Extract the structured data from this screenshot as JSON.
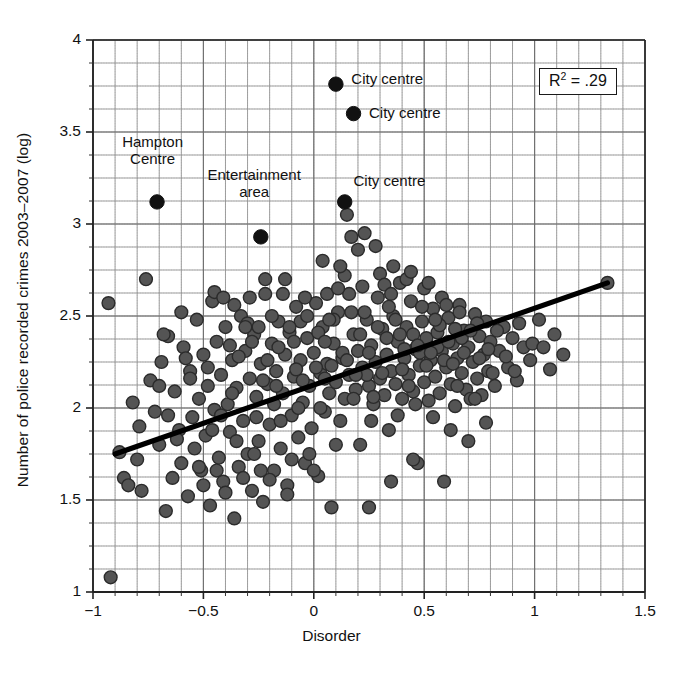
{
  "chart_data": {
    "type": "scatter",
    "title": "",
    "xlabel": "Disorder",
    "ylabel": "Number of police recorded crimes 2003–2007 (log)",
    "xlim": [
      -1,
      1.5
    ],
    "ylim": [
      1,
      4
    ],
    "xticks": [
      -1,
      -0.5,
      0,
      0.5,
      1,
      1.5
    ],
    "xticklabels": [
      "−1",
      "−0.5",
      "0",
      "0.5",
      "1",
      "1.5"
    ],
    "yticks": [
      1,
      1.5,
      2,
      2.5,
      3,
      3.5,
      4
    ],
    "yticklabels": [
      "1",
      "1.5",
      "2",
      "2.5",
      "3",
      "3.5",
      "4"
    ],
    "grid": true,
    "grid_minor_x_step": 0.1,
    "grid_minor_y_step": 0.125,
    "legend": "none",
    "marker_color": "#545454",
    "marker_edge_color": "#2b2b2b",
    "highlight_color": "#111111",
    "fitline_color": "#000000",
    "annotation_box": {
      "label": "R",
      "superscript": "2",
      "equals": " = .29",
      "full_text": "R2 = .29",
      "x": 1.21,
      "y": 3.77
    },
    "fit_line": {
      "name": "linear fit",
      "x": [
        -0.9,
        1.33
      ],
      "y": [
        1.75,
        2.68
      ],
      "slope": 0.417,
      "intercept": 2.125
    },
    "annotations": [
      {
        "text": "Hampton\nCentre",
        "lines": [
          "Hampton",
          "Centre"
        ],
        "point_x": -0.71,
        "point_y": 3.12,
        "label_x": -0.73,
        "label_y": 3.42,
        "align": "center"
      },
      {
        "text": "Entertainment\narea",
        "lines": [
          "Entertainment",
          "area"
        ],
        "point_x": -0.24,
        "point_y": 2.93,
        "label_x": -0.27,
        "label_y": 3.24,
        "align": "center"
      },
      {
        "text": "City centre",
        "lines": [
          "City centre"
        ],
        "point_x": 0.1,
        "point_y": 3.76,
        "label_x": 0.17,
        "label_y": 3.78,
        "align": "left"
      },
      {
        "text": "City centre",
        "lines": [
          "City centre"
        ],
        "point_x": 0.18,
        "point_y": 3.6,
        "label_x": 0.25,
        "label_y": 3.6,
        "align": "left"
      },
      {
        "text": "City centre",
        "lines": [
          "City centre"
        ],
        "point_x": 0.14,
        "point_y": 3.12,
        "label_x": 0.18,
        "label_y": 3.23,
        "align": "left"
      }
    ],
    "highlight_points": [
      {
        "x": -0.71,
        "y": 3.12,
        "label": "Hampton Centre"
      },
      {
        "x": -0.24,
        "y": 2.93,
        "label": "Entertainment area"
      },
      {
        "x": 0.1,
        "y": 3.76,
        "label": "City centre"
      },
      {
        "x": 0.18,
        "y": 3.6,
        "label": "City centre"
      },
      {
        "x": 0.14,
        "y": 3.12,
        "label": "City centre"
      }
    ],
    "points": [
      [
        -0.93,
        2.57
      ],
      [
        -0.92,
        1.08
      ],
      [
        -0.88,
        1.76
      ],
      [
        -0.86,
        1.62
      ],
      [
        -0.84,
        1.58
      ],
      [
        -0.82,
        2.03
      ],
      [
        -0.8,
        1.72
      ],
      [
        -0.79,
        1.9
      ],
      [
        -0.78,
        1.55
      ],
      [
        -0.76,
        2.7
      ],
      [
        -0.74,
        2.15
      ],
      [
        -0.72,
        1.98
      ],
      [
        -0.7,
        1.8
      ],
      [
        -0.69,
        2.25
      ],
      [
        -0.67,
        1.44
      ],
      [
        -0.66,
        2.39
      ],
      [
        -0.64,
        1.62
      ],
      [
        -0.63,
        2.09
      ],
      [
        -0.61,
        1.88
      ],
      [
        -0.6,
        1.7
      ],
      [
        -0.59,
        2.33
      ],
      [
        -0.57,
        1.52
      ],
      [
        -0.56,
        2.2
      ],
      [
        -0.55,
        1.95
      ],
      [
        -0.54,
        1.78
      ],
      [
        -0.53,
        2.48
      ],
      [
        -0.52,
        2.05
      ],
      [
        -0.51,
        1.66
      ],
      [
        -0.5,
        2.29
      ],
      [
        -0.49,
        1.85
      ],
      [
        -0.48,
        2.12
      ],
      [
        -0.47,
        1.47
      ],
      [
        -0.46,
        2.58
      ],
      [
        -0.45,
        1.99
      ],
      [
        -0.44,
        2.36
      ],
      [
        -0.43,
        1.73
      ],
      [
        -0.42,
        2.18
      ],
      [
        -0.41,
        1.6
      ],
      [
        -0.4,
        2.44
      ],
      [
        -0.39,
        2.02
      ],
      [
        -0.38,
        1.87
      ],
      [
        -0.37,
        2.26
      ],
      [
        -0.36,
        1.4
      ],
      [
        -0.35,
        2.11
      ],
      [
        -0.34,
        1.68
      ],
      [
        -0.33,
        2.5
      ],
      [
        -0.32,
        1.93
      ],
      [
        -0.31,
        2.31
      ],
      [
        -0.3,
        1.75
      ],
      [
        -0.29,
        2.16
      ],
      [
        -0.28,
        1.55
      ],
      [
        -0.27,
        2.4
      ],
      [
        -0.26,
        2.06
      ],
      [
        -0.25,
        1.82
      ],
      [
        -0.24,
        2.24
      ],
      [
        -0.23,
        1.49
      ],
      [
        -0.22,
        2.62
      ],
      [
        -0.21,
        2.13
      ],
      [
        -0.2,
        1.91
      ],
      [
        -0.19,
        2.35
      ],
      [
        -0.18,
        1.66
      ],
      [
        -0.17,
        2.2
      ],
      [
        -0.16,
        2.47
      ],
      [
        -0.15,
        1.78
      ],
      [
        -0.14,
        2.08
      ],
      [
        -0.13,
        2.29
      ],
      [
        -0.12,
        1.58
      ],
      [
        -0.11,
        2.41
      ],
      [
        -0.1,
        1.96
      ],
      [
        -0.09,
        2.17
      ],
      [
        -0.08,
        2.55
      ],
      [
        -0.07,
        1.84
      ],
      [
        -0.06,
        2.26
      ],
      [
        -0.05,
        2.03
      ],
      [
        -0.04,
        1.7
      ],
      [
        -0.03,
        2.38
      ],
      [
        -0.02,
        2.12
      ],
      [
        -0.01,
        1.89
      ],
      [
        0.0,
        2.3
      ],
      [
        0.01,
        2.57
      ],
      [
        0.02,
        1.63
      ],
      [
        0.03,
        2.19
      ],
      [
        0.04,
        2.44
      ],
      [
        0.05,
        1.98
      ],
      [
        0.06,
        2.24
      ],
      [
        0.07,
        2.08
      ],
      [
        0.08,
        1.46
      ],
      [
        0.09,
        2.35
      ],
      [
        0.1,
        2.14
      ],
      [
        0.11,
        2.52
      ],
      [
        0.12,
        1.93
      ],
      [
        0.13,
        2.27
      ],
      [
        0.14,
        2.05
      ],
      [
        0.15,
        3.05
      ],
      [
        0.16,
        2.18
      ],
      [
        0.17,
        2.93
      ],
      [
        0.18,
        2.4
      ],
      [
        0.19,
        2.1
      ],
      [
        0.2,
        2.31
      ],
      [
        0.21,
        1.8
      ],
      [
        0.22,
        2.22
      ],
      [
        0.23,
        2.95
      ],
      [
        0.24,
        2.48
      ],
      [
        0.25,
        2.12
      ],
      [
        0.26,
        2.34
      ],
      [
        0.27,
        2.02
      ],
      [
        0.28,
        2.25
      ],
      [
        0.29,
        2.6
      ],
      [
        0.3,
        2.16
      ],
      [
        0.31,
        2.43
      ],
      [
        0.32,
        2.07
      ],
      [
        0.33,
        2.29
      ],
      [
        0.34,
        1.88
      ],
      [
        0.35,
        2.2
      ],
      [
        0.36,
        2.5
      ],
      [
        0.37,
        2.13
      ],
      [
        0.38,
        2.36
      ],
      [
        0.39,
        2.68
      ],
      [
        0.4,
        2.05
      ],
      [
        0.41,
        2.27
      ],
      [
        0.42,
        2.44
      ],
      [
        0.43,
        2.18
      ],
      [
        0.44,
        2.58
      ],
      [
        0.45,
        2.09
      ],
      [
        0.46,
        2.32
      ],
      [
        0.47,
        1.7
      ],
      [
        0.48,
        2.23
      ],
      [
        0.49,
        2.47
      ],
      [
        0.5,
        2.14
      ],
      [
        0.51,
        2.38
      ],
      [
        0.52,
        2.04
      ],
      [
        0.53,
        2.26
      ],
      [
        0.54,
        2.54
      ],
      [
        0.55,
        2.17
      ],
      [
        0.56,
        2.41
      ],
      [
        0.57,
        2.08
      ],
      [
        0.58,
        2.31
      ],
      [
        0.59,
        1.6
      ],
      [
        0.6,
        2.22
      ],
      [
        0.61,
        2.49
      ],
      [
        0.62,
        2.13
      ],
      [
        0.63,
        2.35
      ],
      [
        0.64,
        2.01
      ],
      [
        0.65,
        2.27
      ],
      [
        0.66,
        2.56
      ],
      [
        0.67,
        2.19
      ],
      [
        0.68,
        2.42
      ],
      [
        0.69,
        2.1
      ],
      [
        0.7,
        2.33
      ],
      [
        0.71,
        2.05
      ],
      [
        0.72,
        2.25
      ],
      [
        0.73,
        2.51
      ],
      [
        0.74,
        2.16
      ],
      [
        0.75,
        2.39
      ],
      [
        0.76,
        2.07
      ],
      [
        0.77,
        2.29
      ],
      [
        0.78,
        2.47
      ],
      [
        0.79,
        2.2
      ],
      [
        0.8,
        2.36
      ],
      [
        0.82,
        2.12
      ],
      [
        0.84,
        2.31
      ],
      [
        0.86,
        2.44
      ],
      [
        0.88,
        2.22
      ],
      [
        0.9,
        2.38
      ],
      [
        0.92,
        2.15
      ],
      [
        0.95,
        2.33
      ],
      [
        0.98,
        2.26
      ],
      [
        1.02,
        2.48
      ],
      [
        1.07,
        2.21
      ],
      [
        1.13,
        2.29
      ],
      [
        1.33,
        2.68
      ],
      [
        -0.7,
        2.12
      ],
      [
        -0.62,
        1.83
      ],
      [
        -0.58,
        2.27
      ],
      [
        -0.5,
        1.58
      ],
      [
        -0.45,
        2.63
      ],
      [
        -0.4,
        1.54
      ],
      [
        -0.36,
        2.56
      ],
      [
        -0.3,
        2.46
      ],
      [
        -0.26,
        1.95
      ],
      [
        -0.22,
        2.7
      ],
      [
        -0.18,
        2.02
      ],
      [
        -0.14,
        2.62
      ],
      [
        -0.1,
        1.72
      ],
      [
        -0.06,
        2.47
      ],
      [
        -0.02,
        1.75
      ],
      [
        0.02,
        2.41
      ],
      [
        0.06,
        2.62
      ],
      [
        0.1,
        1.8
      ],
      [
        0.14,
        2.72
      ],
      [
        0.18,
        2.05
      ],
      [
        0.22,
        2.66
      ],
      [
        0.26,
        1.93
      ],
      [
        0.3,
        2.73
      ],
      [
        0.34,
        2.55
      ],
      [
        0.38,
        1.96
      ],
      [
        0.42,
        2.7
      ],
      [
        0.46,
        2.02
      ],
      [
        0.5,
        2.65
      ],
      [
        0.54,
        1.95
      ],
      [
        0.58,
        2.6
      ],
      [
        0.62,
        1.88
      ],
      [
        0.66,
        2.52
      ],
      [
        0.7,
        1.82
      ],
      [
        0.74,
        2.46
      ],
      [
        0.78,
        1.92
      ],
      [
        -0.68,
        2.4
      ],
      [
        -0.6,
        2.52
      ],
      [
        -0.52,
        1.68
      ],
      [
        -0.44,
        1.66
      ],
      [
        -0.38,
        2.34
      ],
      [
        -0.32,
        1.62
      ],
      [
        -0.28,
        2.36
      ],
      [
        -0.2,
        1.61
      ],
      [
        -0.16,
        2.33
      ],
      [
        -0.12,
        1.53
      ],
      [
        -0.08,
        2.21
      ],
      [
        -0.04,
        2.6
      ],
      [
        0.0,
        1.66
      ],
      [
        0.04,
        2.8
      ],
      [
        0.08,
        2.23
      ],
      [
        0.12,
        2.77
      ],
      [
        0.16,
        2.62
      ],
      [
        0.2,
        2.86
      ],
      [
        0.24,
        2.18
      ],
      [
        0.28,
        2.88
      ],
      [
        0.32,
        2.67
      ],
      [
        0.36,
        2.77
      ],
      [
        0.4,
        2.21
      ],
      [
        0.44,
        2.74
      ],
      [
        0.48,
        2.3
      ],
      [
        0.52,
        2.68
      ],
      [
        0.56,
        2.33
      ],
      [
        0.6,
        2.56
      ],
      [
        0.64,
        2.43
      ],
      [
        0.68,
        2.3
      ],
      [
        -0.35,
        1.82
      ],
      [
        -0.31,
        2.44
      ],
      [
        -0.27,
        1.75
      ],
      [
        -0.23,
        2.15
      ],
      [
        -0.19,
        2.5
      ],
      [
        -0.15,
        1.93
      ],
      [
        -0.11,
        2.44
      ],
      [
        -0.07,
        2.0
      ],
      [
        -0.03,
        2.5
      ],
      [
        0.01,
        2.22
      ],
      [
        0.05,
        2.36
      ],
      [
        0.09,
        2.48
      ],
      [
        0.13,
        2.3
      ],
      [
        0.17,
        2.52
      ],
      [
        0.21,
        2.4
      ],
      [
        0.25,
        2.3
      ],
      [
        0.29,
        2.44
      ],
      [
        0.33,
        2.38
      ],
      [
        0.37,
        2.48
      ],
      [
        0.41,
        2.32
      ],
      [
        0.45,
        2.4
      ],
      [
        0.49,
        2.55
      ],
      [
        0.53,
        2.3
      ],
      [
        0.57,
        2.45
      ],
      [
        0.61,
        2.36
      ],
      [
        -0.48,
        2.22
      ],
      [
        -0.42,
        1.96
      ],
      [
        -0.34,
        2.28
      ],
      [
        -0.24,
        1.66
      ],
      [
        -0.13,
        2.7
      ],
      [
        -0.05,
        2.15
      ],
      [
        0.03,
        2.0
      ],
      [
        0.11,
        2.65
      ],
      [
        0.19,
        2.18
      ],
      [
        0.27,
        2.06
      ],
      [
        0.35,
        2.62
      ],
      [
        0.43,
        2.12
      ],
      [
        0.51,
        2.23
      ],
      [
        0.59,
        2.26
      ],
      [
        0.67,
        2.38
      ],
      [
        0.75,
        2.27
      ],
      [
        0.83,
        2.42
      ],
      [
        0.91,
        2.2
      ],
      [
        0.99,
        2.35
      ],
      [
        1.09,
        2.4
      ],
      [
        -0.66,
        1.96
      ],
      [
        -0.56,
        2.16
      ],
      [
        -0.46,
        1.88
      ],
      [
        -0.41,
        2.6
      ],
      [
        -0.29,
        2.6
      ],
      [
        -0.21,
        2.26
      ],
      [
        -0.09,
        2.36
      ],
      [
        0.07,
        2.48
      ],
      [
        0.15,
        2.26
      ],
      [
        0.23,
        2.52
      ],
      [
        0.31,
        2.19
      ],
      [
        0.39,
        2.4
      ],
      [
        0.47,
        2.34
      ],
      [
        0.55,
        2.48
      ],
      [
        0.63,
        2.24
      ],
      [
        0.71,
        2.42
      ],
      [
        0.79,
        2.32
      ],
      [
        0.87,
        2.28
      ],
      [
        0.93,
        2.46
      ],
      [
        1.04,
        2.33
      ],
      [
        -0.37,
        2.08
      ],
      [
        -0.25,
        2.44
      ],
      [
        -0.17,
        2.12
      ],
      [
        0.05,
        2.16
      ],
      [
        0.35,
        1.6
      ],
      [
        0.45,
        1.72
      ],
      [
        0.25,
        1.46
      ],
      [
        0.65,
        2.12
      ],
      [
        0.73,
        2.05
      ],
      [
        0.81,
        2.19
      ]
    ]
  },
  "labels": {
    "hampton_line1": "Hampton",
    "hampton_line2": "Centre",
    "entertainment_line1": "Entertainment",
    "entertainment_line2": "area",
    "city_centre_1": "City centre",
    "city_centre_2": "City centre",
    "city_centre_3": "City centre",
    "r2_prefix": "R",
    "r2_sup": "2",
    "r2_value": " = .29"
  }
}
